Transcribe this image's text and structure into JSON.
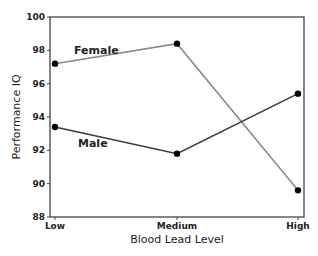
{
  "chart_data": {
    "type": "line",
    "title": "",
    "xlabel": "Blood Lead Level",
    "ylabel": "Performance IQ",
    "categories": [
      "Low",
      "Medium",
      "High"
    ],
    "series": [
      {
        "name": "Female",
        "values": [
          97.2,
          98.4,
          89.6
        ],
        "color": "#888888"
      },
      {
        "name": "Male",
        "values": [
          93.4,
          91.8,
          95.4
        ],
        "color": "#3a3a3a"
      }
    ],
    "ylim": [
      88,
      100
    ],
    "yticks": [
      88,
      90,
      92,
      94,
      96,
      98,
      100
    ],
    "grid": false,
    "legend": "inline labels"
  }
}
